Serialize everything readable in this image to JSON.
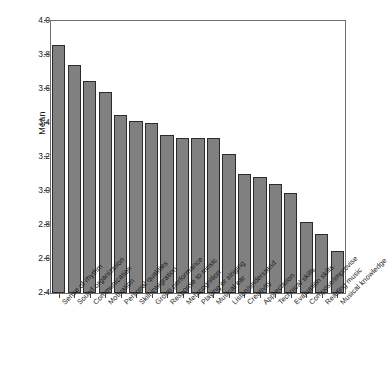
{
  "chart_data": {
    "type": "bar",
    "title": "",
    "subtitle": "",
    "xlabel": "",
    "ylabel": "Mean",
    "ylim": [
      2.4,
      4.0
    ],
    "yticks": [
      "2.4",
      "2.6",
      "2.8",
      "3.0",
      "3.2",
      "3.4",
      "3.6",
      "3.8",
      "4.0"
    ],
    "ytick_values": [
      2.4,
      2.6,
      2.8,
      3.0,
      3.2,
      3.4,
      3.6,
      3.8,
      4.0
    ],
    "grid": false,
    "legend": "none",
    "orientation": "vertical",
    "bar_color": "#808080",
    "bar_edge_color": "#2b2b2b",
    "frame_color": "#6e6e6e",
    "background": "#ffffff",
    "xtick_rotation": -45,
    "categories": [
      "Sense of rhythm",
      "Sound organization",
      "Communication",
      "Motivation",
      "Personal qualities",
      "Skill integration",
      "Group performance",
      "Response to music",
      "Metacognition",
      "Playing or singing",
      "Musical ear",
      "Listen/understand",
      "Creativity",
      "Appreciation",
      "Technical skills",
      "Evaluation skills",
      "Compose/improvise",
      "Reading music",
      "Musical knowledge"
    ],
    "values": [
      3.86,
      3.74,
      3.65,
      3.58,
      3.45,
      3.41,
      3.4,
      3.33,
      3.31,
      3.31,
      3.31,
      3.22,
      3.1,
      3.08,
      3.04,
      2.99,
      2.82,
      2.75,
      2.65
    ]
  }
}
